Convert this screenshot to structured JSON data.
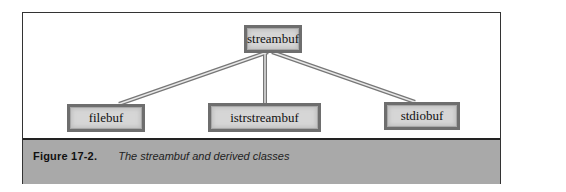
{
  "diagram": {
    "root": {
      "label": "streambuf"
    },
    "children": [
      {
        "label": "filebuf"
      },
      {
        "label": "istrstreambuf"
      },
      {
        "label": "stdiobuf"
      }
    ]
  },
  "caption": {
    "label": "Figure 17-2.",
    "text": "The streambuf and derived classes"
  },
  "colors": {
    "caption_band": "#a9a9a9",
    "node_fill": "#d6d6d6",
    "node_border": "#6e6e6e",
    "frame_border": "#333333"
  }
}
